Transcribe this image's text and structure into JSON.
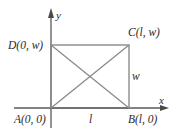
{
  "figure": {
    "type": "coordinate-geometry-diagram",
    "axes": {
      "x_label": "x",
      "y_label": "y"
    },
    "vertices": {
      "A": {
        "label": "A(0, 0)",
        "coords": [
          0,
          0
        ]
      },
      "B": {
        "label": "B(l, 0)",
        "coords": [
          "l",
          0
        ]
      },
      "C": {
        "label": "C(l, w)",
        "coords": [
          "l",
          "w"
        ]
      },
      "D": {
        "label": "D(0, w)",
        "coords": [
          0,
          "w"
        ]
      }
    },
    "dimensions": {
      "length_label": "l",
      "width_label": "w"
    },
    "segments": [
      "AB",
      "BC",
      "CD",
      "DA",
      "AC",
      "BD"
    ],
    "colors": {
      "lines": "#8a8a8a",
      "axes": "#5a5a5a",
      "text": "#2a2a2a",
      "background": "#ffffff"
    }
  }
}
